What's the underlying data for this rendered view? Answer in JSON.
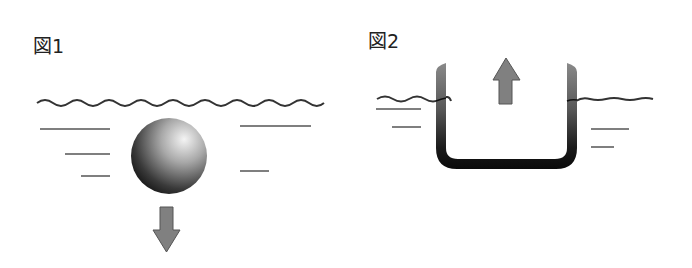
{
  "figures": [
    {
      "id": "fig1",
      "label": "図1",
      "description": "Solid sphere sinking below the water surface",
      "object": "sphere",
      "arrow_direction": "down",
      "arrow_meaning": "sinks"
    },
    {
      "id": "fig2",
      "label": "図2",
      "description": "Open U-shaped container floating at the water surface",
      "object": "open-container",
      "arrow_direction": "up",
      "arrow_meaning": "floats"
    }
  ],
  "colors": {
    "water_line": "#333333",
    "arrow_fill": "#808080",
    "arrow_stroke": "#555555",
    "object_dark": "#111111",
    "object_light": "#f2f2f2"
  }
}
